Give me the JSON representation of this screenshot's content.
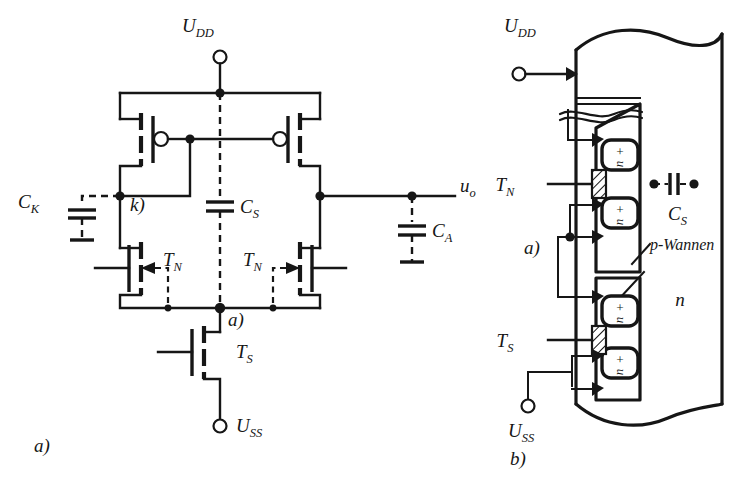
{
  "figure": {
    "panels": [
      {
        "id": "a",
        "caption": "a)"
      },
      {
        "id": "b",
        "caption": "b)"
      }
    ]
  },
  "panel_a": {
    "caption": "a)",
    "terminals": {
      "supply_top": {
        "label": "U",
        "sub": "DD"
      },
      "supply_bottom": {
        "label": "U",
        "sub": "SS"
      },
      "output": {
        "label": "u",
        "sub": "o"
      }
    },
    "nodes": {
      "node_k": "k)",
      "node_a": "a)"
    },
    "capacitors": [
      {
        "name": "C",
        "sub": "K",
        "style": "dashed"
      },
      {
        "name": "C",
        "sub": "S",
        "style": "dashed"
      },
      {
        "name": "C",
        "sub": "A",
        "style": "dashed"
      }
    ],
    "transistors": [
      {
        "name": "T",
        "sub": "N",
        "type": "nmos",
        "position": "left"
      },
      {
        "name": "T",
        "sub": "N",
        "type": "nmos",
        "position": "right"
      },
      {
        "name": "T",
        "sub": "S",
        "type": "nmos",
        "position": "bottom"
      },
      {
        "name": "",
        "sub": "",
        "type": "pmos",
        "position": "upper-left"
      },
      {
        "name": "",
        "sub": "",
        "type": "pmos",
        "position": "upper-right"
      }
    ]
  },
  "panel_b": {
    "caption": "b)",
    "terminals": {
      "supply_top": {
        "label": "U",
        "sub": "DD"
      },
      "supply_bottom": {
        "label": "U",
        "sub": "SS"
      }
    },
    "nodes": {
      "node_a": "a)"
    },
    "device_labels": [
      {
        "name": "T",
        "sub": "N"
      },
      {
        "name": "T",
        "sub": "S"
      }
    ],
    "capacitor": {
      "name": "C",
      "sub": "S"
    },
    "region_labels": {
      "well": "p-Wannen",
      "substrate": "n",
      "diffusion_sign": "+",
      "diffusion_type": "n"
    }
  },
  "colors": {
    "ink": "#161616",
    "paper": "#ffffff"
  }
}
